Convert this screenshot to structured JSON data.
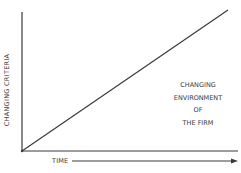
{
  "diagram": {
    "y_axis_label": "CHANGING CRITERIA",
    "x_axis_label": "TIME",
    "annotation_lines": [
      "CHANGING",
      "ENVIRONMENT",
      "OF",
      "THE FIRM"
    ],
    "line_color": "#3a3a3a"
  }
}
